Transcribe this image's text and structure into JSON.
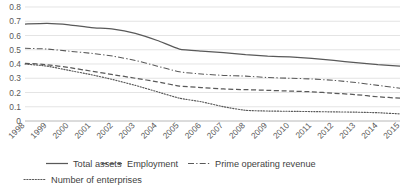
{
  "chart_data": {
    "type": "line",
    "title": "",
    "xlabel": "",
    "ylabel": "",
    "ylim": [
      0,
      0.8
    ],
    "ytick_labels": [
      "0",
      "0.1",
      "0.2",
      "0.3",
      "0.4",
      "0.5",
      "0.6",
      "0.7",
      "0.8"
    ],
    "ytick_values": [
      0,
      0.1,
      0.2,
      0.3,
      0.4,
      0.5,
      0.6,
      0.7,
      0.8
    ],
    "grid": true,
    "legend_position": "bottom",
    "categories": [
      1998,
      1999,
      2000,
      2001,
      2002,
      2003,
      2004,
      2005,
      2006,
      2007,
      2008,
      2009,
      2010,
      2011,
      2012,
      2013,
      2014,
      2015
    ],
    "xtick_labels": [
      "1998",
      "1999",
      "2000",
      "2001",
      "2002",
      "2003",
      "2004",
      "2005",
      "2006",
      "2007",
      "2008",
      "2009",
      "2010",
      "2011",
      "2012",
      "2013",
      "2014",
      "2015"
    ],
    "series": [
      {
        "name": "Total assets",
        "style": "solid",
        "values": [
          0.68,
          0.685,
          0.675,
          0.655,
          0.645,
          0.615,
          0.565,
          0.505,
          0.49,
          0.48,
          0.465,
          0.455,
          0.45,
          0.44,
          0.425,
          0.41,
          0.395,
          0.385
        ]
      },
      {
        "name": "Employment",
        "style": "dashed",
        "values": [
          0.405,
          0.395,
          0.375,
          0.35,
          0.325,
          0.3,
          0.275,
          0.245,
          0.235,
          0.225,
          0.22,
          0.215,
          0.21,
          0.205,
          0.195,
          0.185,
          0.17,
          0.16
        ]
      },
      {
        "name": "Prime operating revenue",
        "style": "dashdot",
        "values": [
          0.51,
          0.505,
          0.49,
          0.475,
          0.455,
          0.425,
          0.385,
          0.345,
          0.33,
          0.32,
          0.315,
          0.305,
          0.3,
          0.295,
          0.285,
          0.27,
          0.25,
          0.23
        ]
      },
      {
        "name": "Number of enterprises",
        "style": "dotted",
        "values": [
          0.4,
          0.385,
          0.355,
          0.325,
          0.29,
          0.25,
          0.205,
          0.16,
          0.135,
          0.1,
          0.075,
          0.07,
          0.068,
          0.066,
          0.064,
          0.062,
          0.058,
          0.05
        ]
      }
    ]
  },
  "legend": {
    "items": [
      {
        "label": "Total assets",
        "style": "solid"
      },
      {
        "label": "Employment",
        "style": "dashed"
      },
      {
        "label": "Prime operating revenue",
        "style": "dashdot"
      },
      {
        "label": "Number of enterprises",
        "style": "dotted"
      }
    ]
  },
  "colors": {
    "series": "#595959",
    "grid": "#d9d9d9",
    "axis": "#a6a6a6",
    "text": "#595959",
    "background": "#ffffff"
  }
}
